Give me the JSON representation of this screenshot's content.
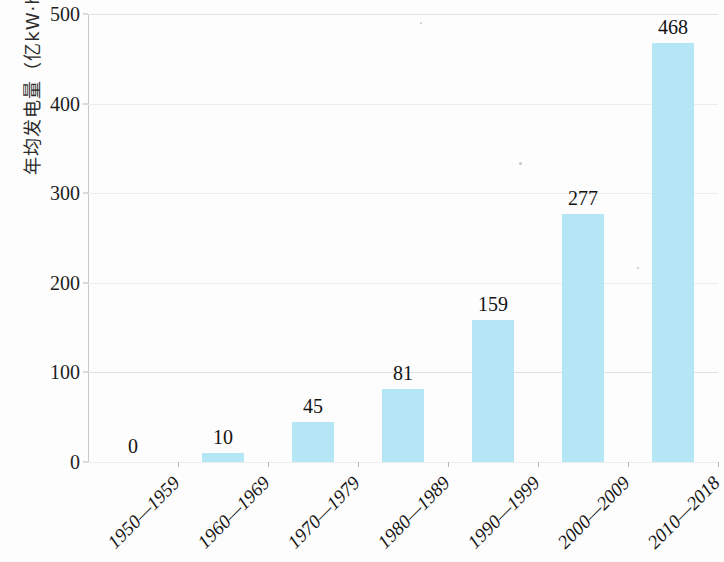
{
  "chart_data": {
    "type": "bar",
    "title": "",
    "xlabel": "",
    "ylabel": "年均发电量（亿kW·h）",
    "ylim": [
      0,
      500
    ],
    "yticks": [
      0,
      100,
      200,
      300,
      400,
      500
    ],
    "grid": true,
    "legend": "none",
    "bar_color": "#b5e6f5",
    "categories": [
      "1950—1959",
      "1960—1969",
      "1970—1979",
      "1980—1989",
      "1990—1999",
      "2000—2009",
      "2010—2018"
    ],
    "values": [
      0,
      10,
      45,
      81,
      159,
      277,
      468
    ],
    "data_labels": [
      "0",
      "10",
      "45",
      "81",
      "159",
      "277",
      "468"
    ]
  },
  "axis": {
    "y_tick_labels": [
      "0",
      "100",
      "200",
      "300",
      "400",
      "500"
    ]
  }
}
